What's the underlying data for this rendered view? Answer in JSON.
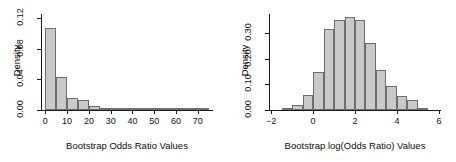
{
  "figure": {
    "background_color": "#ffffff",
    "bar_fill_color": "#c9c9c9",
    "bar_border_color": "#6e6e6e",
    "axis_color": "#1a1a1a",
    "panel_count": 2
  },
  "chart_data": [
    {
      "type": "bar",
      "title": "",
      "xlabel": "Bootstrap Odds Ratio Values",
      "ylabel": "Density",
      "xlim": [
        -2,
        77
      ],
      "ylim": [
        0,
        0.125
      ],
      "xticks": [
        0,
        10,
        20,
        30,
        40,
        50,
        60,
        70
      ],
      "xticklabels": [
        "0",
        "10",
        "20",
        "30",
        "40",
        "50",
        "60",
        "70"
      ],
      "yticks": [
        0.0,
        0.04,
        0.08,
        0.12
      ],
      "yticklabels": [
        "0.00",
        "0.04",
        "0.08",
        "0.12"
      ],
      "grid": false,
      "legend": "none",
      "bin_width": 5,
      "bin_edges": [
        0,
        5,
        10,
        15,
        20,
        25,
        30,
        35,
        40,
        45,
        50,
        55,
        60,
        65,
        70,
        75
      ],
      "values": [
        0.107,
        0.043,
        0.015,
        0.013,
        0.0055,
        0.0022,
        0.0018,
        0.0016,
        0.0004,
        0.0008,
        0.0012,
        0.0016,
        0.0004,
        0.0,
        0.0006
      ]
    },
    {
      "type": "bar",
      "title": "",
      "xlabel": "Bootstrap log(Odds Ratio) Values",
      "ylabel": "Density",
      "xlim": [
        -2.1,
        6.1
      ],
      "ylim": [
        0,
        0.375
      ],
      "xticks": [
        -2,
        0,
        2,
        4,
        6
      ],
      "xticklabels": [
        "−2",
        "0",
        "2",
        "4",
        "6"
      ],
      "yticks": [
        0.0,
        0.1,
        0.2,
        0.3
      ],
      "yticklabels": [
        "0.00",
        "0.10",
        "0.20",
        "0.30"
      ],
      "grid": false,
      "legend": "none",
      "bin_width": 0.5,
      "bin_edges": [
        -1.5,
        -1.0,
        -0.5,
        0.0,
        0.5,
        1.0,
        1.5,
        2.0,
        2.5,
        3.0,
        3.5,
        4.0,
        4.5,
        5.0,
        5.5
      ],
      "values": [
        0.006,
        0.018,
        0.058,
        0.147,
        0.318,
        0.352,
        0.362,
        0.352,
        0.262,
        0.155,
        0.093,
        0.055,
        0.038,
        0.009
      ]
    }
  ]
}
